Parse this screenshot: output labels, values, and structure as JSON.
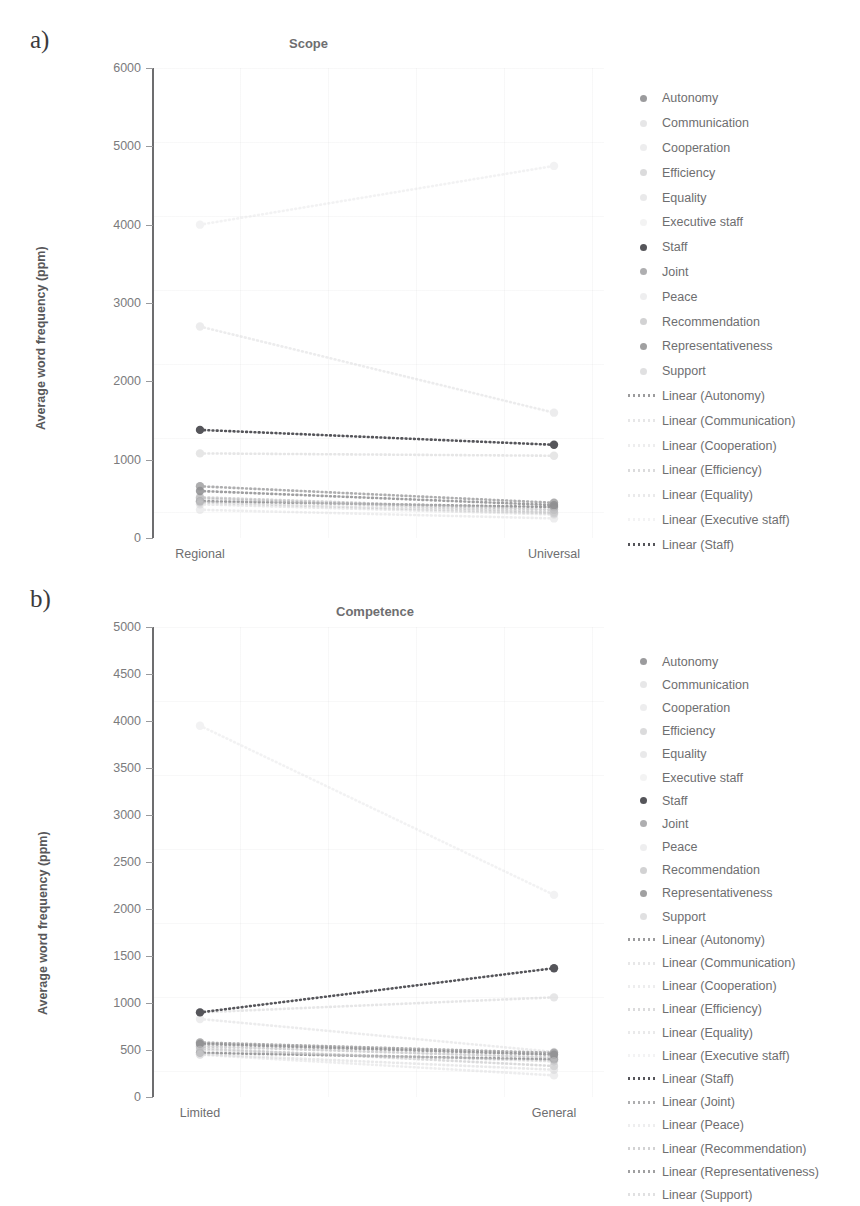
{
  "figure": {
    "panels": [
      {
        "letter": "a)",
        "title": "Scope",
        "ylabel": "Average word frequency (ppm)",
        "categories": [
          "Regional",
          "Universal"
        ],
        "yticks": [
          "0",
          "1000",
          "2000",
          "3000",
          "4000",
          "5000",
          "6000"
        ]
      },
      {
        "letter": "b)",
        "title": "Competence",
        "ylabel": "Average word frequency (ppm)",
        "categories": [
          "Limited",
          "General"
        ],
        "yticks": [
          "0",
          "500",
          "1000",
          "1500",
          "2000",
          "2500",
          "3000",
          "3500",
          "4000",
          "4500",
          "5000"
        ]
      }
    ]
  },
  "chart_data": [
    {
      "type": "line",
      "title": "Scope",
      "xlabel": "",
      "ylabel": "Average word frequency (ppm)",
      "categories": [
        "Regional",
        "Universal"
      ],
      "ylim": [
        0,
        6000
      ],
      "ytick_step": 1000,
      "grid": false,
      "legend_position": "right",
      "marker_style": "dotted-line-with-endpoint-markers",
      "series": [
        {
          "name": "Autonomy",
          "values": [
            470,
            395
          ],
          "color": "#8a8a8c",
          "opacity": 0.85
        },
        {
          "name": "Communication",
          "values": [
            1080,
            1050
          ],
          "color": "#c8c8ca",
          "opacity": 0.45
        },
        {
          "name": "Cooperation",
          "values": [
            2700,
            1600
          ],
          "color": "#d2d2d4",
          "opacity": 0.4
        },
        {
          "name": "Efficiency",
          "values": [
            505,
            330
          ],
          "color": "#bdbdbf",
          "opacity": 0.55
        },
        {
          "name": "Equality",
          "values": [
            430,
            300
          ],
          "color": "#cfcfd1",
          "opacity": 0.45
        },
        {
          "name": "Executive staff",
          "values": [
            4000,
            4750
          ],
          "color": "#dcdcde",
          "opacity": 0.35
        },
        {
          "name": "Staff",
          "values": [
            1380,
            1190
          ],
          "color": "#55555a",
          "opacity": 1.0
        },
        {
          "name": "Joint",
          "values": [
            660,
            450
          ],
          "color": "#9a9a9c",
          "opacity": 0.8
        },
        {
          "name": "Peace",
          "values": [
            360,
            250
          ],
          "color": "#d6d6d8",
          "opacity": 0.42
        },
        {
          "name": "Recommendation",
          "values": [
            520,
            360
          ],
          "color": "#b4b4b6",
          "opacity": 0.6
        },
        {
          "name": "Representativeness",
          "values": [
            600,
            420
          ],
          "color": "#8f8f91",
          "opacity": 0.85
        },
        {
          "name": "Support",
          "values": [
            455,
            315
          ],
          "color": "#c2c2c4",
          "opacity": 0.5
        }
      ],
      "trendlines": [
        "Linear (Autonomy)",
        "Linear (Communication)",
        "Linear (Cooperation)",
        "Linear (Efficiency)",
        "Linear (Equality)",
        "Linear (Executive staff)",
        "Linear (Staff)"
      ]
    },
    {
      "type": "line",
      "title": "Competence",
      "xlabel": "",
      "ylabel": "Average word frequency (ppm)",
      "categories": [
        "Limited",
        "General"
      ],
      "ylim": [
        0,
        5000
      ],
      "ytick_step": 500,
      "grid": false,
      "legend_position": "right",
      "marker_style": "dotted-line-with-endpoint-markers",
      "series": [
        {
          "name": "Autonomy",
          "values": [
            470,
            400
          ],
          "color": "#8a8a8c",
          "opacity": 0.85
        },
        {
          "name": "Communication",
          "values": [
            900,
            1060
          ],
          "color": "#cacacc",
          "opacity": 0.45
        },
        {
          "name": "Cooperation",
          "values": [
            830,
            480
          ],
          "color": "#d2d2d4",
          "opacity": 0.4
        },
        {
          "name": "Efficiency",
          "values": [
            520,
            330
          ],
          "color": "#bdbdbf",
          "opacity": 0.55
        },
        {
          "name": "Equality",
          "values": [
            455,
            290
          ],
          "color": "#cfcfd1",
          "opacity": 0.45
        },
        {
          "name": "Executive staff",
          "values": [
            3950,
            2150
          ],
          "color": "#dcdcde",
          "opacity": 0.35
        },
        {
          "name": "Staff",
          "values": [
            900,
            1370
          ],
          "color": "#55555a",
          "opacity": 1.0
        },
        {
          "name": "Joint",
          "values": [
            580,
            470
          ],
          "color": "#9a9a9c",
          "opacity": 0.8
        },
        {
          "name": "Peace",
          "values": [
            450,
            230
          ],
          "color": "#d6d6d8",
          "opacity": 0.42
        },
        {
          "name": "Recommendation",
          "values": [
            540,
            420
          ],
          "color": "#b4b4b6",
          "opacity": 0.6
        },
        {
          "name": "Representativeness",
          "values": [
            565,
            450
          ],
          "color": "#8f8f91",
          "opacity": 0.85
        },
        {
          "name": "Support",
          "values": [
            500,
            380
          ],
          "color": "#c2c2c4",
          "opacity": 0.5
        }
      ],
      "trendlines": [
        "Linear (Autonomy)",
        "Linear (Communication)",
        "Linear (Cooperation)",
        "Linear (Efficiency)",
        "Linear (Equality)",
        "Linear (Executive staff)",
        "Linear (Staff)",
        "Linear (Joint)",
        "Linear (Peace)",
        "Linear (Recommendation)",
        "Linear (Representativeness)",
        "Linear (Support)"
      ]
    }
  ]
}
